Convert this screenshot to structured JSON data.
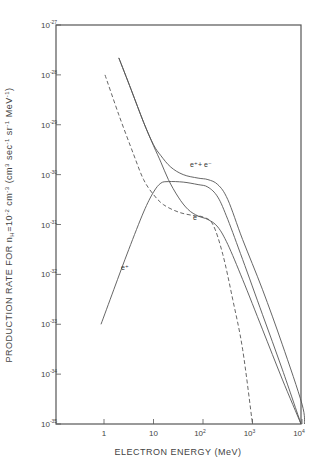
{
  "chart_data": {
    "type": "line",
    "title": "",
    "xlabel": "ELECTRON ENERGY (MeV)",
    "ylabel": "PRODUCTION RATE FOR n_H=10^-2 cm^-3 (cm^3 sec^-1 sr^-1 MeV^-1)",
    "x_scale": "log",
    "y_scale": "log",
    "xlim": [
      0.1,
      10000
    ],
    "ylim": [
      1e-35,
      1e-27
    ],
    "grid": false,
    "x_ticks": [
      {
        "value": 1,
        "label": "1",
        "sup": ""
      },
      {
        "value": 10,
        "label": "10",
        "sup": ""
      },
      {
        "value": 100,
        "label": "10",
        "sup": "2"
      },
      {
        "value": 1000,
        "label": "10",
        "sup": "3"
      },
      {
        "value": 10000,
        "label": "10",
        "sup": "4"
      }
    ],
    "y_ticks": [
      {
        "exp": -27,
        "label": "10",
        "sup": "-27"
      },
      {
        "exp": -28,
        "label": "10",
        "sup": "-28"
      },
      {
        "exp": -29,
        "label": "10",
        "sup": "-29"
      },
      {
        "exp": -30,
        "label": "10",
        "sup": "-30"
      },
      {
        "exp": -31,
        "label": "10",
        "sup": "-31"
      },
      {
        "exp": -32,
        "label": "10",
        "sup": "-32"
      },
      {
        "exp": -33,
        "label": "10",
        "sup": "-33"
      },
      {
        "exp": -34,
        "label": "10",
        "sup": "-34"
      },
      {
        "exp": -35,
        "label": "10",
        "sup": "-35"
      }
    ],
    "series": [
      {
        "name": "e+ + e-",
        "style": "solid",
        "label_pos": {
          "x": 34.0,
          "y": 4e-30
        },
        "log_points": [
          [
            0.3,
            -27.66
          ],
          [
            0.55,
            -28.3
          ],
          [
            0.8,
            -28.95
          ],
          [
            1.0,
            -29.4
          ],
          [
            1.15,
            -29.62
          ],
          [
            1.35,
            -29.85
          ],
          [
            1.6,
            -30.0
          ],
          [
            1.9,
            -30.07
          ],
          [
            2.1,
            -30.1
          ],
          [
            2.3,
            -30.2
          ],
          [
            2.5,
            -30.5
          ],
          [
            2.8,
            -31.3
          ],
          [
            3.2,
            -32.3
          ],
          [
            3.6,
            -33.4
          ],
          [
            4.0,
            -34.6
          ],
          [
            4.05,
            -35.0
          ]
        ]
      },
      {
        "name": "e-",
        "style": "solid",
        "label_pos": {
          "x": 65.0,
          "y": 7e-31
        },
        "log_points": [
          [
            0.3,
            -27.66
          ],
          [
            0.55,
            -28.3
          ],
          [
            0.8,
            -28.95
          ],
          [
            1.0,
            -29.42
          ],
          [
            1.15,
            -29.75
          ],
          [
            1.3,
            -30.1
          ],
          [
            1.5,
            -30.45
          ],
          [
            1.7,
            -30.7
          ],
          [
            1.9,
            -30.83
          ],
          [
            2.1,
            -30.9
          ],
          [
            2.3,
            -31.05
          ],
          [
            2.5,
            -31.4
          ],
          [
            2.8,
            -32.1
          ],
          [
            3.2,
            -33.1
          ],
          [
            3.6,
            -34.1
          ],
          [
            3.98,
            -35.0
          ]
        ]
      },
      {
        "name": "e- (dashed)",
        "style": "dashed",
        "log_points": [
          [
            0.02,
            -28.0
          ],
          [
            0.3,
            -28.8
          ],
          [
            0.6,
            -29.6
          ],
          [
            0.8,
            -30.1
          ],
          [
            1.0,
            -30.4
          ],
          [
            1.2,
            -30.6
          ],
          [
            1.5,
            -30.75
          ],
          [
            1.8,
            -30.82
          ],
          [
            2.0,
            -30.85
          ],
          [
            2.2,
            -31.0
          ],
          [
            2.4,
            -31.6
          ],
          [
            2.6,
            -32.5
          ],
          [
            2.8,
            -33.5
          ],
          [
            3.0,
            -35.0
          ]
        ]
      },
      {
        "name": "e+",
        "style": "solid",
        "label_pos": {
          "x": 2.3,
          "y": 2e-32
        },
        "log_points": [
          [
            -0.06,
            -33.0
          ],
          [
            0.2,
            -32.3
          ],
          [
            0.5,
            -31.5
          ],
          [
            0.8,
            -30.75
          ],
          [
            1.0,
            -30.35
          ],
          [
            1.15,
            -30.17
          ],
          [
            1.3,
            -30.14
          ],
          [
            1.6,
            -30.15
          ],
          [
            1.9,
            -30.2
          ],
          [
            2.1,
            -30.25
          ],
          [
            2.3,
            -30.45
          ],
          [
            2.5,
            -30.9
          ],
          [
            2.8,
            -31.7
          ],
          [
            3.2,
            -32.8
          ],
          [
            3.6,
            -33.9
          ],
          [
            3.98,
            -35.0
          ]
        ]
      }
    ]
  },
  "labels": {
    "series_e_sum": "e⁺+ e⁻",
    "series_e_minus": "e⁻",
    "series_e_plus": "e⁺"
  }
}
